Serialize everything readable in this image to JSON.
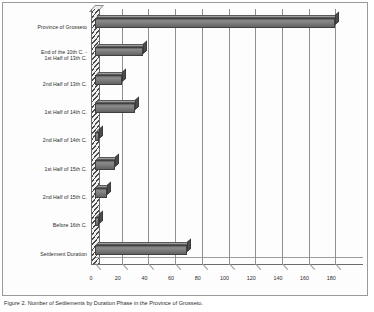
{
  "chart_data": {
    "type": "bar",
    "orientation": "horizontal",
    "title": "",
    "xlabel": "",
    "ylabel": "",
    "xlim": [
      0,
      190
    ],
    "grid": true,
    "legend": false,
    "style": "3d-bar",
    "categories": [
      "Province of Grosseto",
      "End of the 10th C. -\n1st Half of 13th C.",
      "2nd Half of 13th C.",
      "1st Half of 14th C.",
      "2nd Half of 14th C.",
      "1st Half of 15th C.",
      "2nd Half of 15th C.",
      "Before 16th C.",
      "Settlement Duration"
    ],
    "values": [
      180,
      36,
      20,
      30,
      3,
      15,
      9,
      3,
      69
    ],
    "tick_labels": [
      "0",
      "20",
      "40",
      "60",
      "80",
      "100",
      "120",
      "140",
      "160",
      "180"
    ],
    "tick_values": [
      0,
      20,
      40,
      60,
      80,
      100,
      120,
      140,
      160,
      180
    ],
    "bar_color": "#7b7b7b",
    "bar_edge_color": "#3f3f3f",
    "gridline_color": "#8f8f8f",
    "background_color": "#fdfdfd",
    "frame_color": "#9a9a9a"
  },
  "caption": {
    "text": "Figure 2. Number of Settlements by Duration Phase in the Province of Grosseto."
  }
}
